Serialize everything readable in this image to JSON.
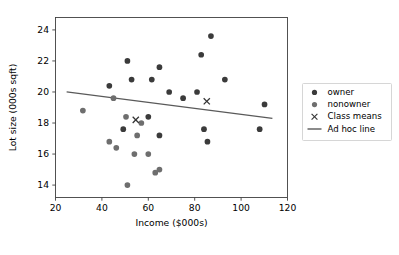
{
  "chart_data": {
    "type": "scatter",
    "title": "",
    "xlabel": "Income ($000s)",
    "ylabel": "Lot size (000s sqft)",
    "xlim": [
      20,
      120
    ],
    "ylim": [
      13.2,
      24.8
    ],
    "xticks": [
      20,
      40,
      60,
      80,
      100,
      120
    ],
    "yticks": [
      14,
      16,
      18,
      20,
      22,
      24
    ],
    "grid": false,
    "legend_position": "right outside",
    "legend": [
      {
        "label": "owner",
        "marker": "circle",
        "color": "#3b3b3b"
      },
      {
        "label": "nonowner",
        "marker": "circle",
        "color": "#6e6e6e"
      },
      {
        "label": "Class means",
        "marker": "x",
        "color": "#333333"
      },
      {
        "label": "Ad hoc line",
        "marker": "line",
        "color": "#5a5a5a"
      }
    ],
    "series": [
      {
        "name": "owner",
        "color": "#3b3b3b",
        "marker": "circle",
        "points": [
          {
            "x": 60.0,
            "y": 18.4
          },
          {
            "x": 85.5,
            "y": 16.8
          },
          {
            "x": 64.8,
            "y": 21.6
          },
          {
            "x": 61.5,
            "y": 20.8
          },
          {
            "x": 87.0,
            "y": 23.6
          },
          {
            "x": 110.1,
            "y": 19.2
          },
          {
            "x": 108.0,
            "y": 17.6
          },
          {
            "x": 82.8,
            "y": 22.4
          },
          {
            "x": 69.0,
            "y": 20.0
          },
          {
            "x": 93.0,
            "y": 20.8
          },
          {
            "x": 51.0,
            "y": 22.0
          },
          {
            "x": 81.0,
            "y": 20.0
          },
          {
            "x": 75.0,
            "y": 19.6
          },
          {
            "x": 52.8,
            "y": 20.8
          },
          {
            "x": 64.8,
            "y": 17.2
          },
          {
            "x": 43.2,
            "y": 20.4
          },
          {
            "x": 84.0,
            "y": 17.6
          },
          {
            "x": 49.2,
            "y": 17.6
          }
        ]
      },
      {
        "name": "nonowner",
        "color": "#6e6e6e",
        "marker": "circle",
        "points": [
          {
            "x": 31.8,
            "y": 18.8
          },
          {
            "x": 51.0,
            "y": 14.0
          },
          {
            "x": 45.0,
            "y": 19.6
          },
          {
            "x": 46.2,
            "y": 16.4
          },
          {
            "x": 43.2,
            "y": 16.8
          },
          {
            "x": 57.0,
            "y": 18.0
          },
          {
            "x": 64.8,
            "y": 15.0
          },
          {
            "x": 63.0,
            "y": 14.8
          },
          {
            "x": 55.2,
            "y": 17.2
          },
          {
            "x": 50.4,
            "y": 18.4
          },
          {
            "x": 60.0,
            "y": 16.0
          },
          {
            "x": 54.0,
            "y": 16.0
          }
        ]
      }
    ],
    "class_means": {
      "name": "Class means",
      "color": "#333333",
      "marker": "x",
      "points": [
        {
          "x": 54.6,
          "y": 18.2
        },
        {
          "x": 85.2,
          "y": 19.4
        }
      ]
    },
    "ad_hoc_line": {
      "name": "Ad hoc line",
      "color": "#5a5a5a",
      "x": [
        24.8,
        113.5
      ],
      "y": [
        20.0,
        18.3
      ]
    }
  }
}
